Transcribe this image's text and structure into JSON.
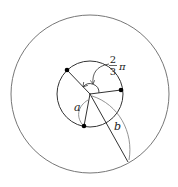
{
  "diagram": {
    "title": "",
    "outer_circle": {
      "cx": 90,
      "cy": 94,
      "r": 79
    },
    "inner_circle": {
      "cx": 90,
      "cy": 94,
      "r": 33
    },
    "center": {
      "x": 90,
      "y": 94
    },
    "points": [
      {
        "name": "upper-left",
        "x": 67,
        "y": 70
      },
      {
        "name": "right",
        "x": 121,
        "y": 90
      },
      {
        "name": "bottom",
        "x": 84,
        "y": 126
      }
    ],
    "outer_point": {
      "x": 128,
      "y": 162
    },
    "labels": {
      "angle_numerator": "2",
      "angle_denominator": "3",
      "angle_symbol": "π",
      "a": "a",
      "b": "b"
    },
    "colors": {
      "stroke": "#333333",
      "light_stroke": "#777777",
      "dot": "#000000"
    }
  }
}
